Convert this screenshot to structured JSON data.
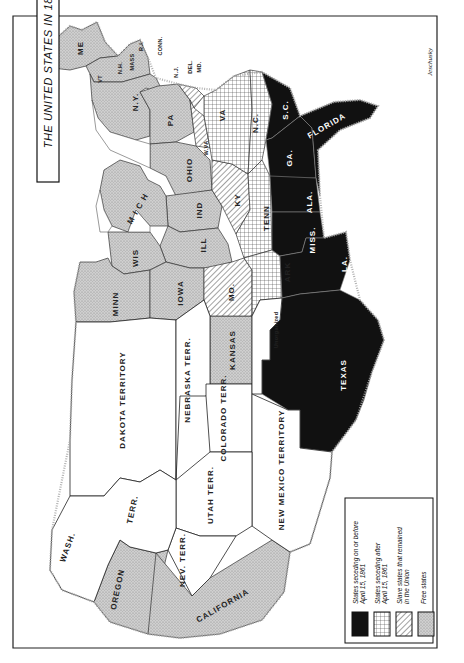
{
  "map": {
    "title": "THE UNITED STATES IN 1861",
    "signature": "Jeschusky",
    "orientation": "rotated 90° clockwise (north at left)",
    "colors": {
      "seceded_before": "#111111",
      "seceded_after": "#e8e8e8",
      "slave_union": "#f4f4f4",
      "free": "#c8c8c8",
      "territory": "#ffffff",
      "border": "#222222"
    },
    "legend": [
      {
        "key": "seceded_before",
        "label": "States seceding on or before April 15, 1861",
        "line1": "States seceding on or before",
        "line2": "April 15, 1861",
        "pattern": "solid-black"
      },
      {
        "key": "seceded_after",
        "label": "States seceding after April 15, 1861",
        "line1": "States seceding after",
        "line2": "April 15, 1861",
        "pattern": "crosshatch"
      },
      {
        "key": "slave_union",
        "label": "Slave states that remained in the Union",
        "line1": "Slave states that remained",
        "line2": "in the Union",
        "pattern": "diagonal-lines"
      },
      {
        "key": "free",
        "label": "Free states",
        "line1": "Free states",
        "line2": "",
        "pattern": "gray-stipple"
      }
    ],
    "regions": {
      "free": [
        "ME",
        "N.H.",
        "VT",
        "MASS",
        "R.I.",
        "CONN.",
        "N.Y.",
        "N.J.",
        "PA",
        "OHIO",
        "IND",
        "ILL",
        "MICH",
        "WIS",
        "MINN",
        "IOWA",
        "KANSAS",
        "OREGON",
        "CALIFORNIA"
      ],
      "slave_union": [
        "DEL.",
        "MD.",
        "W.VA",
        "KY",
        "MO."
      ],
      "seceded_after": [
        "VA",
        "N.C.",
        "TENN",
        "ARK"
      ],
      "seceded_before": [
        "S.C.",
        "GA.",
        "FLORIDA",
        "ALA.",
        "MISS.",
        "LA.",
        "TEXAS"
      ],
      "territory": [
        "DAKOTA TERRITORY",
        "NEBRASKA TERR.",
        "COLORADO TERR.",
        "UTAH TERR.",
        "NEV. TERR.",
        "NEW MEXICO TERRITORY",
        "WASH. TERR.",
        "Unorganized"
      ]
    },
    "labels": {
      "me": "ME",
      "nh": "N.H.",
      "vt": "VT",
      "mass": "MASS",
      "ri": "R.I.",
      "conn": "CONN.",
      "ny": "N.Y.",
      "nj": "N.J.",
      "del": "DEL.",
      "md": "MD.",
      "pa": "PA",
      "va": "VA",
      "wva": "W.VA",
      "wva_note": "Adm. 1863",
      "nc": "N.C.",
      "ohio": "OHIO",
      "ind": "IND",
      "ill": "ILL",
      "ky": "KY",
      "tenn": "TENN",
      "sc": "S.C.",
      "ga": "GA.",
      "florida": "FLORIDA",
      "ala": "ALA.",
      "miss": "MISS.",
      "la": "LA.",
      "ark": "ARK",
      "mo": "MO.",
      "mich": "M I C H",
      "wis": "WIS",
      "minn": "MINN",
      "iowa": "IOWA",
      "kansas": "KANSAS",
      "texas": "TEXAS",
      "unorganized": "Unorganized",
      "dakota": "DAKOTA TERRITORY",
      "nebraska": "NEBRASKA TERR.",
      "colorado": "COLORADO TERR.",
      "utah": "UTAH TERR.",
      "nev": "NEV. TERR.",
      "newmexico": "NEW MEXICO TERRITORY",
      "wash": "WASH.",
      "wash_terr": "TERR.",
      "oregon": "OREGON",
      "california": "CALIFORNIA"
    }
  }
}
